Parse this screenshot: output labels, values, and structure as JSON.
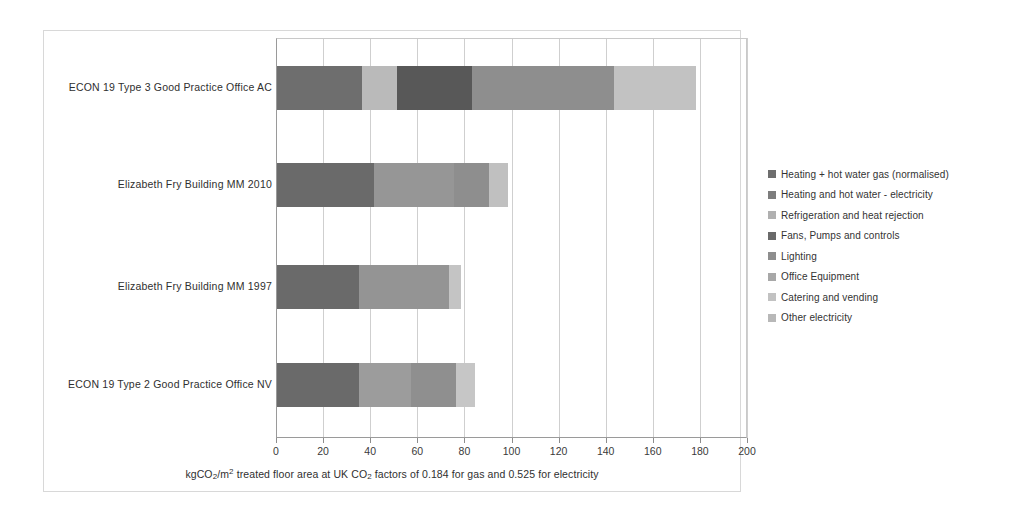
{
  "chart_data": {
    "type": "bar",
    "orientation": "horizontal",
    "stacked": true,
    "title": "",
    "xlabel": "kgCO2/m2 treated floor area at UK CO2 factors of 0.184 for gas and 0.525 for electricity",
    "ylabel": "",
    "xlim": [
      0,
      200
    ],
    "xticks": [
      0,
      20,
      40,
      60,
      80,
      100,
      120,
      140,
      160,
      180,
      200
    ],
    "grid": true,
    "legend_position": "right",
    "categories": [
      "ECON 19 Type 3 Good Practice Office AC",
      "Elizabeth Fry Building MM 2010",
      "Elizabeth Fry Building MM 1997",
      "ECON 19 Type 2 Good Practice Office NV"
    ],
    "series": [
      {
        "name": "Heating + hot water gas (normalised)",
        "color": "#6e6e6e",
        "values": [
          36,
          41,
          35,
          35
        ]
      },
      {
        "name": "Heating and hot water - electricity",
        "color": "#b5b5b5",
        "values": [
          15,
          0,
          0,
          0
        ]
      },
      {
        "name": "Refrigeration and heat rejection",
        "color": "#5a5a5a",
        "values": [
          32,
          0,
          0,
          0
        ]
      },
      {
        "name": "Fans, Pumps and controls",
        "color": "#8a8a8a",
        "values": [
          0,
          34,
          0,
          22
        ]
      },
      {
        "name": "Lighting",
        "color": "#9a9a9a",
        "values": [
          60,
          0,
          38,
          0
        ]
      },
      {
        "name": "Office Equipment",
        "color": "#a5a5a5",
        "values": [
          0,
          15,
          0,
          19
        ]
      },
      {
        "name": "Catering and vending",
        "color": "#c4c4c4",
        "values": [
          35,
          0,
          5,
          0
        ]
      },
      {
        "name": "Other electricity",
        "color": "#bdbdbd",
        "values": [
          0,
          8,
          0,
          8
        ]
      }
    ],
    "bar_totals": [
      178,
      98,
      78,
      84
    ],
    "bars": [
      {
        "category": "ECON 19 Type 3 Good Practice Office AC",
        "total": 178,
        "segments": [
          {
            "label": "Heating + hot water gas (normalised)",
            "value": 36,
            "color": "#6e6e6e"
          },
          {
            "label": "Heating and hot water - electricity",
            "value": 15,
            "color": "#bababa"
          },
          {
            "label": "Refrigeration and heat rejection",
            "value": 32,
            "color": "#585858"
          },
          {
            "label": "Fans, Pumps and controls",
            "value": 60,
            "color": "#8e8e8e"
          },
          {
            "label": "Catering and vending",
            "value": 35,
            "color": "#c2c2c2"
          }
        ]
      },
      {
        "category": "Elizabeth Fry Building MM 2010",
        "total": 98,
        "segments": [
          {
            "label": "Heating + hot water gas (normalised)",
            "value": 41,
            "color": "#6a6a6a"
          },
          {
            "label": "Fans, Pumps and controls",
            "value": 34,
            "color": "#969696"
          },
          {
            "label": "Office Equipment",
            "value": 15,
            "color": "#8e8e8e"
          },
          {
            "label": "Other electricity",
            "value": 8,
            "color": "#c0c0c0"
          }
        ]
      },
      {
        "category": "Elizabeth Fry Building MM 1997",
        "total": 78,
        "segments": [
          {
            "label": "Heating + hot water gas (normalised)",
            "value": 35,
            "color": "#6a6a6a"
          },
          {
            "label": "Lighting",
            "value": 38,
            "color": "#949494"
          },
          {
            "label": "Catering and vending",
            "value": 5,
            "color": "#c4c4c4"
          }
        ]
      },
      {
        "category": "ECON 19 Type 2 Good Practice Office NV",
        "total": 84,
        "segments": [
          {
            "label": "Heating + hot water gas (normalised)",
            "value": 35,
            "color": "#6a6a6a"
          },
          {
            "label": "Fans, Pumps and controls",
            "value": 22,
            "color": "#9c9c9c"
          },
          {
            "label": "Office Equipment",
            "value": 19,
            "color": "#8f8f8f"
          },
          {
            "label": "Other electricity",
            "value": 8,
            "color": "#c6c6c6"
          }
        ]
      }
    ]
  },
  "axis": {
    "title_prefix": "kgCO",
    "title_sub1": "2",
    "title_mid": "/m",
    "title_sup": "2",
    "title_rest": " treated floor area at UK CO",
    "title_sub2": "2",
    "title_end": " factors of 0.184 for gas and 0.525 for electricity"
  },
  "legend": {
    "items": [
      {
        "label": "Heating + hot water gas (normalised)",
        "color": "#6e6e6e"
      },
      {
        "label": "Heating and hot water - electricity",
        "color": "#7d7d7d"
      },
      {
        "label": "Refrigeration and heat rejection",
        "color": "#b0b0b0"
      },
      {
        "label": "Fans, Pumps and controls",
        "color": "#6a6a6a"
      },
      {
        "label": "Lighting",
        "color": "#8e8e8e"
      },
      {
        "label": "Office Equipment",
        "color": "#a8a8a8"
      },
      {
        "label": "Catering and vending",
        "color": "#c2c2c2"
      },
      {
        "label": "Other electricity",
        "color": "#b8b8b8"
      }
    ]
  }
}
